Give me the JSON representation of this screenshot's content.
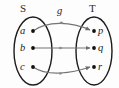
{
  "figure": {
    "type": "mapping-diagram",
    "background_color": "#fdfdfd",
    "stroke_color": "#1c1c1c",
    "arrow_color": "#6e6e6e"
  },
  "mapping": {
    "name": "g",
    "domain_label": "S",
    "codomain_label": "T",
    "domain_elements": [
      {
        "label": "a"
      },
      {
        "label": "b"
      },
      {
        "label": "c"
      }
    ],
    "codomain_elements": [
      {
        "label": "p"
      },
      {
        "label": "q"
      },
      {
        "label": "r"
      }
    ],
    "arrows": [
      {
        "from": "a",
        "to": "p"
      },
      {
        "from": "b",
        "to": "q"
      },
      {
        "from": "c",
        "to": "r"
      }
    ]
  }
}
